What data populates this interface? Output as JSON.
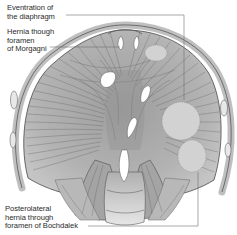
{
  "figure": {
    "labels": [
      {
        "id": "eventration",
        "text": "Eventration of\nthe diaphragm"
      },
      {
        "id": "morgagni",
        "text": "Hernia though\nforamen\nof Morgagni"
      },
      {
        "id": "bochdalek",
        "text": "Posterolateral\nhernia through\nforamen of Bochdalek"
      }
    ],
    "colors": {
      "muscle": "#a9a9a9",
      "muscle_dark": "#8c8c8c",
      "tendon": "#9a9a9a",
      "hernia_area": "#cfcfcf",
      "outline": "#4a4a4a",
      "leader_line": "#6e6e6e",
      "background": "#ffffff"
    }
  }
}
